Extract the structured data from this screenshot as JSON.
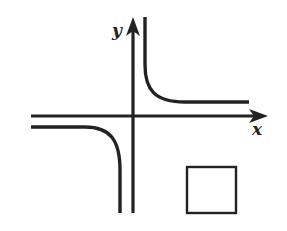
{
  "figure": {
    "type": "function-graph",
    "axes": {
      "x_label": "x",
      "y_label": "y"
    },
    "branches": [
      {
        "name": "upper-right-branch",
        "quadrant": "I"
      },
      {
        "name": "lower-left-branch",
        "quadrant": "III"
      }
    ],
    "answer_box": {
      "content": ""
    },
    "colors": {
      "stroke": "#222222",
      "background": "#ffffff"
    }
  }
}
